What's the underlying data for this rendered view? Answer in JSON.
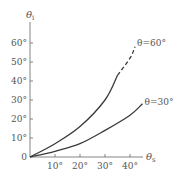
{
  "chart_data": {
    "type": "line",
    "title": "",
    "xlabel": "θs",
    "ylabel": "θi",
    "xlim": [
      0,
      47
    ],
    "ylim": [
      0,
      68
    ],
    "grid": false,
    "legend_position": "inline-at-curve-ends",
    "x_ticks": [
      "10°",
      "20°",
      "30°",
      "40°"
    ],
    "y_ticks": [
      "0",
      "10°",
      "20°",
      "30°",
      "40°",
      "50°",
      "60°"
    ],
    "series": [
      {
        "name": "θ=60°",
        "x": [
          0,
          10,
          20,
          30,
          35,
          40,
          42
        ],
        "y": [
          0,
          7,
          16,
          30,
          43,
          52,
          58
        ],
        "solid_until_x": 35,
        "dashed_after_x": 35
      },
      {
        "name": "θ=30°",
        "x": [
          0,
          10,
          20,
          30,
          40,
          45
        ],
        "y": [
          0,
          3,
          7,
          14,
          22,
          28
        ]
      }
    ]
  },
  "axes": {
    "x_label_main": "θ",
    "x_label_sub": "s",
    "y_label_main": "θ",
    "y_label_sub": "i",
    "origin_label": "0"
  },
  "colors": {
    "line": "#3a3a3a",
    "axis": "#666666",
    "text": "#555555"
  }
}
